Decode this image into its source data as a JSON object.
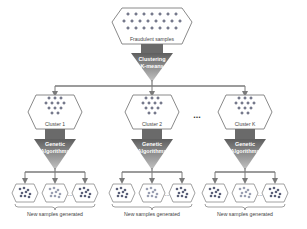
{
  "root": {
    "label": "Fraudulent samples"
  },
  "root_step": {
    "line1": "Clustering",
    "line2": "K-means"
  },
  "clusters": [
    {
      "label": "Cluster 1",
      "step_line1": "Genetic",
      "step_line2": "Algorithms",
      "output_label": "New samples generated"
    },
    {
      "label": "Cluster 2",
      "step_line1": "Genetic",
      "step_line2": "Algorithms",
      "output_label": "New samples generated"
    },
    {
      "label": "Cluster K",
      "step_line1": "Genetic",
      "step_line2": "Algorithms",
      "output_label": "New samples generated"
    }
  ],
  "ellipsis": "...",
  "inner_ellipsis": "...",
  "colors": {
    "outline": "#8a8a8a",
    "line": "#7a7a7a",
    "plus": "#3a3f5a",
    "dot": "#5a5f78",
    "funnel_top": "#6b6b6b",
    "funnel_bottom": "#b5b5b5",
    "funnel_text": "#ffffff"
  }
}
